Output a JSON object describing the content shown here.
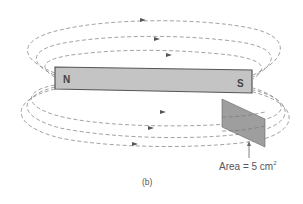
{
  "figure": {
    "caption": "(b)",
    "magnet": {
      "north_label": "N",
      "south_label": "S",
      "fill_color": "#c4c4c4",
      "stroke_color": "#555555"
    },
    "area_label": {
      "prefix": "Area = 5 cm",
      "exponent": "2"
    },
    "plate": {
      "fill_color": "#9e9e9e",
      "stroke_color": "#666666"
    },
    "field_lines": {
      "style": "dashed",
      "color": "#8a8a8a",
      "direction": "N to S (left to right, arrows pointing right)",
      "upper_loops": 3,
      "lower_loops": 3
    },
    "icons": [
      "arrow-up-icon",
      "field-arrow-icon"
    ]
  }
}
